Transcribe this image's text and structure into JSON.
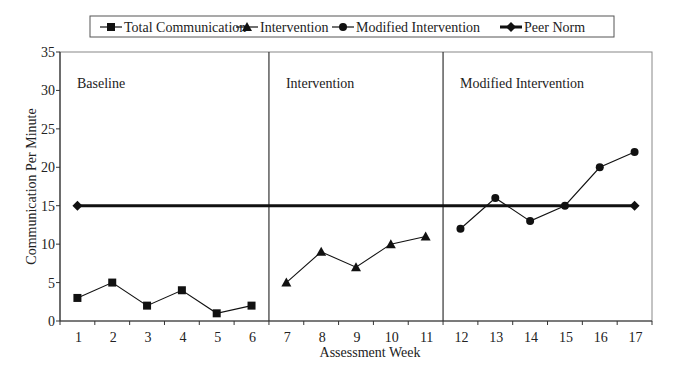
{
  "chart_data": {
    "type": "line",
    "title": "",
    "xlabel": "Assessment Week",
    "ylabel": "Communication Per Minute",
    "ylim": [
      0,
      35
    ],
    "yticks": [
      0,
      5,
      10,
      15,
      20,
      25,
      30,
      35
    ],
    "x": [
      1,
      2,
      3,
      4,
      5,
      6,
      7,
      8,
      9,
      10,
      11,
      12,
      13,
      14,
      15,
      16,
      17
    ],
    "grid": false,
    "legend_position": "top",
    "phases": [
      {
        "label": "Baseline",
        "start": 1,
        "end": 6
      },
      {
        "label": "Intervention",
        "start": 7,
        "end": 11
      },
      {
        "label": "Modified Intervention",
        "start": 12,
        "end": 17
      }
    ],
    "series": [
      {
        "name": "Total Communication",
        "marker": "square",
        "x": [
          1,
          2,
          3,
          4,
          5,
          6
        ],
        "values": [
          3,
          5,
          2,
          4,
          1,
          2
        ]
      },
      {
        "name": "Intervention",
        "marker": "triangle",
        "x": [
          7,
          8,
          9,
          10,
          11
        ],
        "values": [
          5,
          9,
          7,
          10,
          11
        ]
      },
      {
        "name": "Modified Intervention",
        "marker": "circle",
        "x": [
          12,
          13,
          14,
          15,
          16,
          17
        ],
        "values": [
          12,
          16,
          13,
          15,
          20,
          22
        ]
      },
      {
        "name": "Peer Norm",
        "marker": "diamond",
        "x": [
          1,
          17
        ],
        "values": [
          15,
          15
        ]
      }
    ]
  },
  "legend": {
    "items": [
      "Total Communication",
      "Intervention",
      "Modified Intervention",
      "Peer Norm"
    ]
  }
}
